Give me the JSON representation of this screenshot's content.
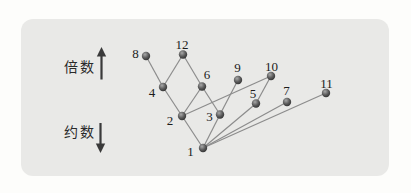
{
  "panel": {
    "background_color": "#e9e9e7",
    "page_background_color": "#fdfdfb"
  },
  "axis_labels": {
    "multiples": "倍数",
    "divisors": "约数"
  },
  "icons": {
    "up": "up-arrow-icon",
    "down": "down-arrow-icon"
  },
  "chart_data": {
    "type": "graph",
    "style": {
      "edge_color": "#8c8c8c",
      "edge_width": 1.2,
      "node_radius": 4.2,
      "node_fill_light": "#a8a8a8",
      "node_fill_dark": "#2e2e2e",
      "label_color": "#1c1c1c",
      "arrow_color": "#3a3a3a"
    },
    "nodes": [
      {
        "value": "1",
        "x": 203,
        "y": 148,
        "lx": 190.5,
        "ly": 156
      },
      {
        "value": "2",
        "x": 182,
        "y": 116,
        "lx": 170,
        "ly": 125
      },
      {
        "value": "3",
        "x": 220,
        "y": 114.5,
        "lx": 209.5,
        "ly": 121
      },
      {
        "value": "4",
        "x": 163,
        "y": 87,
        "lx": 152,
        "ly": 97
      },
      {
        "value": "5",
        "x": 256,
        "y": 103.5,
        "lx": 253,
        "ly": 98
      },
      {
        "value": "6",
        "x": 202,
        "y": 86.5,
        "lx": 207,
        "ly": 79
      },
      {
        "value": "7",
        "x": 287,
        "y": 102,
        "lx": 286.5,
        "ly": 95
      },
      {
        "value": "8",
        "x": 146,
        "y": 56,
        "lx": 135.5,
        "ly": 58
      },
      {
        "value": "9",
        "x": 238,
        "y": 80,
        "lx": 237.5,
        "ly": 72
      },
      {
        "value": "10",
        "x": 271,
        "y": 76,
        "lx": 271.5,
        "ly": 71
      },
      {
        "value": "11",
        "x": 326,
        "y": 93,
        "lx": 326.5,
        "ly": 88
      },
      {
        "value": "12",
        "x": 183,
        "y": 54.5,
        "lx": 182,
        "ly": 49
      }
    ],
    "edges": [
      [
        "1",
        "2"
      ],
      [
        "1",
        "3"
      ],
      [
        "1",
        "5"
      ],
      [
        "1",
        "7"
      ],
      [
        "1",
        "11"
      ],
      [
        "2",
        "4"
      ],
      [
        "2",
        "6"
      ],
      [
        "2",
        "10"
      ],
      [
        "3",
        "6"
      ],
      [
        "3",
        "9"
      ],
      [
        "4",
        "8"
      ],
      [
        "4",
        "12"
      ],
      [
        "5",
        "10"
      ],
      [
        "6",
        "12"
      ]
    ]
  }
}
